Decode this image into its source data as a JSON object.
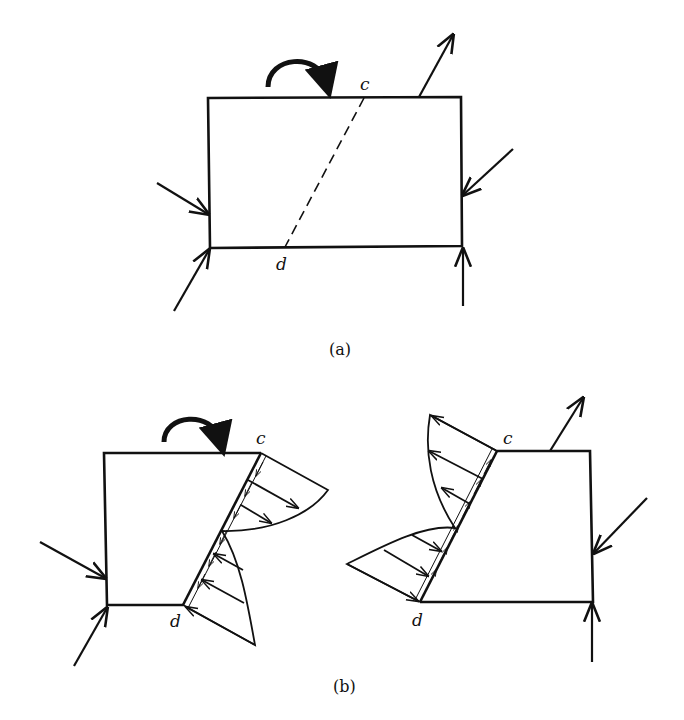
{
  "figure": {
    "part_a": {
      "caption": "(a)",
      "point_c": "c",
      "point_d": "d",
      "elements": [
        "rectangular-body",
        "dashed-cut-line-c-d",
        "moment-arrow",
        "force-arrows"
      ]
    },
    "part_b": {
      "caption": "(b)",
      "left_piece": {
        "point_c": "c",
        "point_d": "d"
      },
      "right_piece": {
        "point_c": "c",
        "point_d": "d"
      },
      "elements": [
        "free-body-left",
        "free-body-right",
        "stress-distributions",
        "moment-arrow",
        "force-arrows"
      ]
    }
  },
  "colors": {
    "ink": "#111111",
    "background": "#ffffff"
  }
}
